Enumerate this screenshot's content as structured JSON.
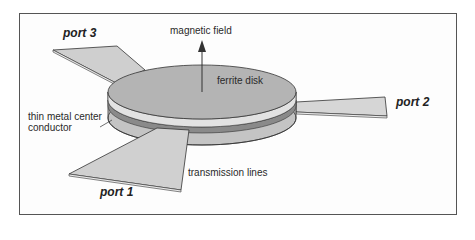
{
  "diagram": {
    "type": "circulator-schematic",
    "labels": {
      "magnetic_field": "magnetic field",
      "ferrite_disk": "ferrite disk",
      "center_conductor_line1": "thin metal center",
      "center_conductor_line2": "conductor",
      "transmission_lines": "transmission lines",
      "port1": "port 1",
      "port2": "port 2",
      "port3": "port 3"
    },
    "colors": {
      "disk_top": "#b4b4b4",
      "disk_side": "#c8c8c8",
      "conductor_layer": "#e2e2e2",
      "port_fill": "#cfcfcf",
      "outline": "#333333"
    }
  }
}
